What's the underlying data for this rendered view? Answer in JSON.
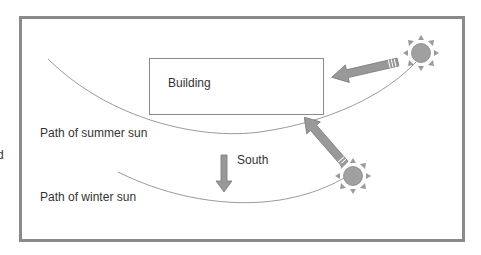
{
  "diagram": {
    "labels": {
      "building": "Building",
      "summer_path": "Path of summer sun",
      "winter_path": "Path of winter sun",
      "south": "South",
      "edge_fragment": "d"
    },
    "icons": {
      "summer_sun": "sun-icon",
      "winter_sun": "sun-icon",
      "summer_ray": "arrow-icon",
      "winter_ray": "arrow-icon",
      "south_arrow": "arrow-down-icon"
    },
    "colors": {
      "frame": "#8a8a8a",
      "building_stroke": "#8a8a8a",
      "path_stroke": "#9a9a9a",
      "arrow_fill": "#999999",
      "arrow_stroke": "#7a7a7a",
      "sun_fill": "#a0a0a0",
      "text": "#333333"
    }
  }
}
